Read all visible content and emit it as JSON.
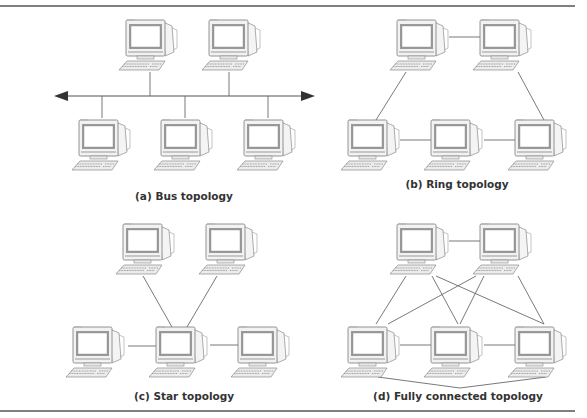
{
  "figure": {
    "title_cutoff": "",
    "colors": {
      "line": "#6a6a6a",
      "rule": "#555555",
      "monitor_case": "#f2f2f2",
      "monitor_outline": "#7a7a7a",
      "screen": "#ffffff",
      "screen_bezel": "#8c8c8c",
      "text": "#333333"
    },
    "panels": [
      {
        "id": "a",
        "caption": "(a) Bus topology",
        "nodes": [
          {
            "x": 125,
            "y": 18
          },
          {
            "x": 208,
            "y": 18
          },
          {
            "x": 78,
            "y": 118
          },
          {
            "x": 160,
            "y": 118
          },
          {
            "x": 243,
            "y": 118
          }
        ],
        "bus": {
          "x1": 54,
          "x2": 315,
          "y": 96
        }
      },
      {
        "id": "b",
        "caption": "(b) Ring topology",
        "nodes": [
          {
            "x": 396,
            "y": 18
          },
          {
            "x": 479,
            "y": 18
          },
          {
            "x": 347,
            "y": 118
          },
          {
            "x": 430,
            "y": 118
          },
          {
            "x": 514,
            "y": 118
          }
        ]
      },
      {
        "id": "c",
        "caption": "(c) Star topology",
        "nodes": [
          {
            "x": 122,
            "y": 222
          },
          {
            "x": 205,
            "y": 222
          },
          {
            "x": 72,
            "y": 325
          },
          {
            "x": 155,
            "y": 325
          },
          {
            "x": 237,
            "y": 325
          }
        ]
      },
      {
        "id": "d",
        "caption": "(d) Fully connected topology",
        "nodes": [
          {
            "x": 396,
            "y": 222
          },
          {
            "x": 479,
            "y": 222
          },
          {
            "x": 347,
            "y": 325
          },
          {
            "x": 430,
            "y": 325
          },
          {
            "x": 514,
            "y": 325
          }
        ]
      }
    ]
  }
}
